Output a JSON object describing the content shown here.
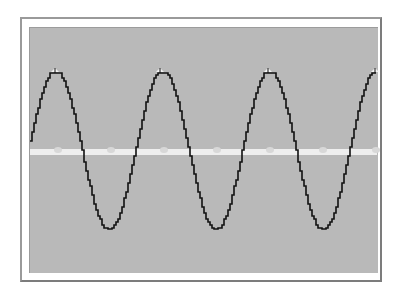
{
  "chart_data": {
    "type": "line",
    "title": "",
    "xlabel": "",
    "ylabel": "",
    "grid": false,
    "legend": null,
    "series": [
      {
        "name": "sine-wave",
        "color": "#111111",
        "amplitude_px": 80,
        "period_px": 107,
        "center_y_px": 150,
        "peaks_x_px": [
          55,
          160,
          268,
          375
        ],
        "troughs_x_px": [
          108,
          214,
          322
        ]
      }
    ],
    "midline": {
      "y_px": 152,
      "color": "#eeeeee",
      "style": "bright band with small bumps"
    },
    "ylim": [
      -1,
      1
    ]
  },
  "colors": {
    "screen_background": "#b9b9b9",
    "frame": "#9a9a9a",
    "trace": "#111111",
    "midline": "#eeeeee"
  }
}
